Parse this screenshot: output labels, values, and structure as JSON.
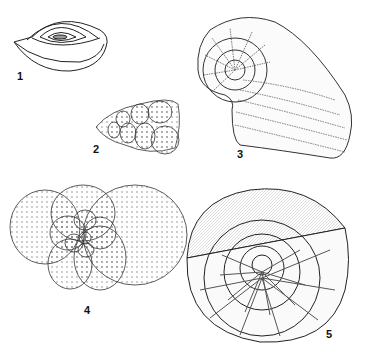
{
  "plate": {
    "figures": [
      {
        "label": "1",
        "name": "miliolid-coiled-test"
      },
      {
        "label": "2",
        "name": "biserial-conical-test"
      },
      {
        "label": "3",
        "name": "planispiral-uncoiling-test"
      },
      {
        "label": "4",
        "name": "globigerinid-trochospiral-test"
      },
      {
        "label": "5",
        "name": "nummulitid-sectioned-test"
      }
    ]
  }
}
